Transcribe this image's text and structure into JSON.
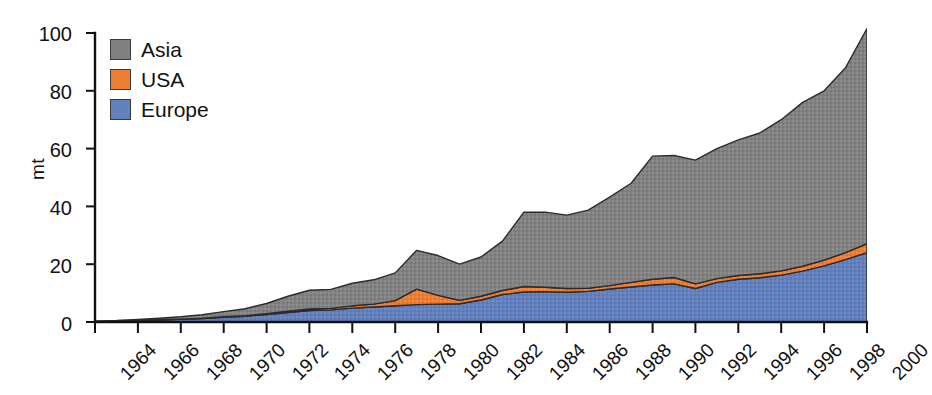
{
  "chart_data": {
    "type": "area",
    "stacked": true,
    "title": "",
    "xlabel": "",
    "ylabel": "mt",
    "grid": false,
    "legend_position": "top-left",
    "xlim": [
      1964,
      2000
    ],
    "ylim": [
      0,
      100
    ],
    "ytick_labels": [
      "0",
      "20",
      "40",
      "60",
      "80",
      "100"
    ],
    "ytick_values": [
      0,
      20,
      40,
      60,
      80,
      100
    ],
    "xtick_labels": [
      "1964",
      "1966",
      "1968",
      "1970",
      "1972",
      "1974",
      "1976",
      "1978",
      "1980",
      "1982",
      "1984",
      "1986",
      "1988",
      "1990",
      "1992",
      "1994",
      "1996",
      "1998",
      "2000"
    ],
    "xtick_values": [
      1964,
      1966,
      1968,
      1970,
      1972,
      1974,
      1976,
      1978,
      1980,
      1982,
      1984,
      1986,
      1988,
      1990,
      1992,
      1994,
      1996,
      1998,
      2000
    ],
    "x": [
      1964,
      1965,
      1966,
      1967,
      1968,
      1969,
      1970,
      1971,
      1972,
      1973,
      1974,
      1975,
      1976,
      1977,
      1978,
      1979,
      1980,
      1981,
      1982,
      1983,
      1984,
      1985,
      1986,
      1987,
      1988,
      1989,
      1990,
      1991,
      1992,
      1993,
      1994,
      1995,
      1996,
      1997,
      1998,
      1999,
      2000
    ],
    "series": [
      {
        "name": "Europe",
        "color": "#6382BD",
        "values": [
          0.2,
          0.3,
          0.5,
          0.7,
          0.9,
          1.2,
          1.6,
          2.0,
          2.6,
          3.3,
          4.0,
          4.2,
          4.8,
          5.2,
          5.6,
          6.0,
          6.2,
          6.3,
          7.6,
          9.5,
          10.4,
          10.5,
          10.3,
          10.6,
          11.4,
          12.1,
          12.8,
          13.2,
          11.6,
          13.7,
          14.8,
          15.3,
          16.2,
          17.6,
          19.4,
          21.6,
          24.0
        ]
      },
      {
        "name": "USA",
        "color": "#ED7D31",
        "values": [
          0.0,
          0.0,
          0.1,
          0.1,
          0.1,
          0.1,
          0.2,
          0.2,
          0.3,
          0.4,
          0.5,
          0.5,
          0.8,
          1.0,
          1.8,
          5.4,
          3.0,
          1.2,
          1.3,
          1.4,
          1.9,
          1.5,
          1.3,
          1.1,
          1.2,
          1.6,
          2.0,
          2.2,
          1.6,
          1.3,
          1.3,
          1.4,
          1.5,
          1.7,
          2.0,
          2.4,
          3.1
        ]
      },
      {
        "name": "Asia",
        "color": "#808080",
        "values": [
          0.1,
          0.2,
          0.3,
          0.5,
          0.8,
          1.2,
          1.8,
          2.4,
          3.5,
          5.2,
          6.5,
          6.6,
          7.8,
          8.4,
          9.6,
          13.4,
          13.8,
          12.5,
          13.6,
          17.1,
          25.7,
          26.0,
          25.4,
          27.0,
          30.6,
          34.3,
          42.6,
          42.2,
          42.8,
          45.0,
          46.9,
          48.7,
          52.3,
          56.7,
          58.6,
          64.0,
          74.4
        ]
      }
    ],
    "totals": [
      0.3,
      0.5,
      0.9,
      1.3,
      1.8,
      2.5,
      3.6,
      4.6,
      6.4,
      8.9,
      11.0,
      11.3,
      13.4,
      14.6,
      17.0,
      24.8,
      23.0,
      20.0,
      22.5,
      28.0,
      38.0,
      38.0,
      37.0,
      38.7,
      43.2,
      48.0,
      57.4,
      57.6,
      56.0,
      60.0,
      63.0,
      65.4,
      70.0,
      76.0,
      80.0,
      88.0,
      101.5
    ]
  }
}
